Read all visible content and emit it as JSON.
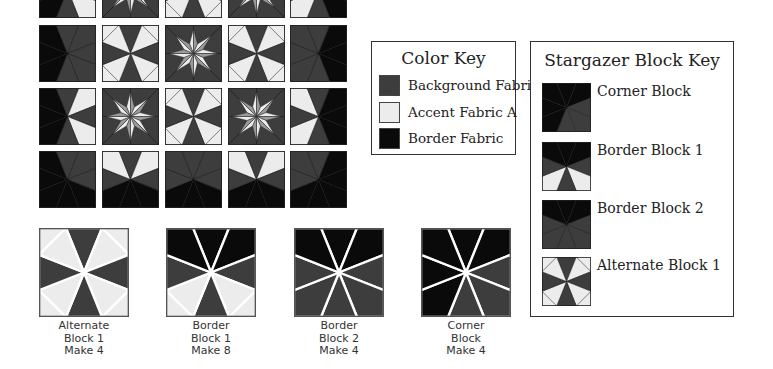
{
  "colors": {
    "background_fabric": "#3d3d3d",
    "accent_fabric_a": "#ececec",
    "border_fabric": "#0a0a0a",
    "star_mid": "#9a9a9a"
  },
  "color_key": {
    "title": "Color Key",
    "items": [
      {
        "label": "Background Fabric",
        "color": "#3d3d3d"
      },
      {
        "label": "Accent Fabric A",
        "color": "#ececec"
      },
      {
        "label": "Border Fabric",
        "color": "#0a0a0a"
      }
    ]
  },
  "block_key": {
    "title": "Stargazer Block Key",
    "items": [
      {
        "label": "Corner Block"
      },
      {
        "label": "Border Block 1"
      },
      {
        "label": "Border Block 2"
      },
      {
        "label": "Alternate Block 1"
      }
    ]
  },
  "blocks": [
    {
      "line1": "Alternate",
      "line2": "Block 1",
      "line3": "Make 4"
    },
    {
      "line1": "Border",
      "line2": "Block 1",
      "line3": "Make 8"
    },
    {
      "line1": "Border",
      "line2": "Block 2",
      "line3": "Make 4"
    },
    {
      "line1": "Corner",
      "line2": "Block",
      "line3": "Make 4"
    }
  ]
}
